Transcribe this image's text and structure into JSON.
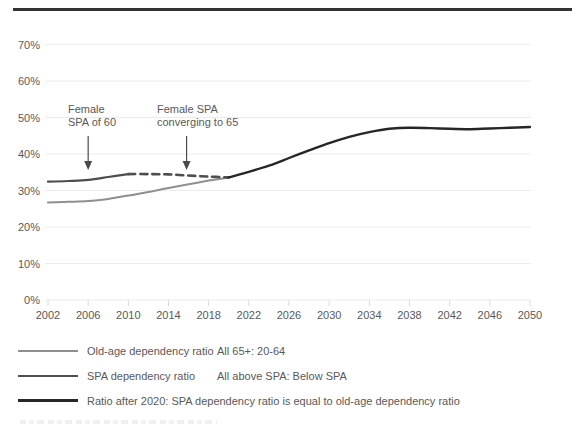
{
  "chart_data": {
    "type": "line",
    "title": "",
    "xlabel": "",
    "ylabel": "",
    "ylim": [
      0,
      70
    ],
    "y_ticks": [
      0,
      10,
      20,
      30,
      40,
      50,
      60,
      70
    ],
    "y_tick_labels": [
      "0%",
      "10%",
      "20%",
      "30%",
      "40%",
      "50%",
      "60%",
      "70%"
    ],
    "xlim": [
      2002,
      2050
    ],
    "x_ticks": [
      2002,
      2006,
      2010,
      2014,
      2018,
      2022,
      2026,
      2030,
      2034,
      2038,
      2042,
      2046,
      2050
    ],
    "grid": "horizontal",
    "legend_position": "bottom",
    "series": [
      {
        "name": "Old-age dependency ratio",
        "segment": "2002-2020",
        "style": "solid",
        "color": "#8f8f8f",
        "width": 2,
        "x": [
          2002,
          2004,
          2006,
          2008,
          2010,
          2012,
          2014,
          2016,
          2018,
          2020
        ],
        "values": [
          26.7,
          26.9,
          27.1,
          27.7,
          28.6,
          29.6,
          30.7,
          31.7,
          32.7,
          33.6
        ]
      },
      {
        "name": "SPA dependency ratio",
        "segment": "2002-2010 (female SPA of 60)",
        "style": "solid",
        "color": "#4d4d4d",
        "width": 2.2,
        "x": [
          2002,
          2004,
          2006,
          2008,
          2010
        ],
        "values": [
          32.4,
          32.6,
          32.9,
          33.7,
          34.5
        ]
      },
      {
        "name": "SPA dependency ratio",
        "segment": "2010-2020 (female SPA converging to 65)",
        "style": "dashed",
        "color": "#4d4d4d",
        "width": 2.6,
        "x": [
          2010,
          2012,
          2014,
          2016,
          2018,
          2020
        ],
        "values": [
          34.5,
          34.5,
          34.4,
          34.1,
          33.8,
          33.6
        ]
      },
      {
        "name": "Ratio after 2020: SPA dependency ratio is equal to old-age dependency ratio",
        "segment": "2020-2050",
        "style": "solid",
        "color": "#262626",
        "width": 2.4,
        "x": [
          2020,
          2022,
          2024,
          2026,
          2028,
          2030,
          2032,
          2034,
          2036,
          2038,
          2040,
          2042,
          2044,
          2046,
          2048,
          2050
        ],
        "values": [
          33.6,
          35.1,
          36.8,
          38.9,
          41.0,
          43.0,
          44.7,
          46.0,
          46.9,
          47.2,
          47.1,
          46.9,
          46.8,
          47.0,
          47.2,
          47.4
        ]
      }
    ],
    "annotations": [
      {
        "line1": "Female",
        "line2": "SPA of 60",
        "arrow_target_year": 2006
      },
      {
        "line1": "Female SPA",
        "line2": "converging to 65",
        "arrow_target_year": 2015.8
      }
    ]
  },
  "legend": {
    "items": [
      {
        "label": "Old-age dependency ratio",
        "description": "All 65+: 20-64",
        "swatch_color": "#8f8f8f",
        "swatch_weight": 2
      },
      {
        "label": "SPA dependency ratio",
        "description": "All above SPA: Below SPA",
        "swatch_color": "#4d4d4d",
        "swatch_weight": 2
      },
      {
        "label": "Ratio after 2020: SPA dependency ratio is equal to old-age dependency ratio",
        "description": "",
        "swatch_color": "#262626",
        "swatch_weight": 3
      }
    ]
  },
  "colors": {
    "grid": "#ececec",
    "axis_tick": "#d9d9d9",
    "text": "#595959",
    "annotation_arrow": "#4a4a4a",
    "top_rule": "#333333"
  }
}
